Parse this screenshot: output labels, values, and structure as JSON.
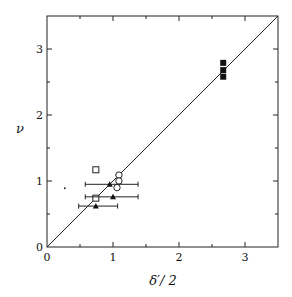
{
  "chart_data": {
    "type": "scatter",
    "title": "",
    "xlabel": "δ′/ 2",
    "ylabel": "ν",
    "xlim": [
      0,
      3.5
    ],
    "ylim": [
      0,
      3.5
    ],
    "x_ticks": [
      0,
      1,
      2,
      3
    ],
    "y_ticks": [
      0,
      1,
      2,
      3
    ],
    "x_minor_ticks": [
      0.5,
      1.5,
      2.5
    ],
    "y_minor_ticks": [
      0.5,
      1.5,
      2.5
    ],
    "grid": false,
    "legend": null,
    "reference_line": {
      "label": "y = x",
      "from": [
        0,
        0
      ],
      "to": [
        3.5,
        3.5
      ]
    },
    "series": [
      {
        "name": "filled-squares",
        "marker": "filled-square",
        "points": [
          {
            "x": 2.67,
            "y": 2.79
          },
          {
            "x": 2.67,
            "y": 2.68
          },
          {
            "x": 2.67,
            "y": 2.58
          }
        ]
      },
      {
        "name": "open-squares",
        "marker": "open-square",
        "points": [
          {
            "x": 0.74,
            "y": 1.17
          },
          {
            "x": 0.74,
            "y": 0.74
          }
        ]
      },
      {
        "name": "open-circles",
        "marker": "open-circle",
        "points": [
          {
            "x": 1.09,
            "y": 1.09
          },
          {
            "x": 1.09,
            "y": 1.0
          },
          {
            "x": 1.06,
            "y": 0.9
          }
        ]
      },
      {
        "name": "filled-triangles",
        "marker": "filled-triangle",
        "points": [
          {
            "x": 0.95,
            "y": 0.95,
            "xerr": [
              0.58,
              1.38
            ]
          },
          {
            "x": 1.0,
            "y": 0.76,
            "xerr": [
              0.58,
              1.38
            ]
          },
          {
            "x": 0.74,
            "y": 0.62,
            "xerr": [
              0.48,
              1.07
            ]
          }
        ]
      },
      {
        "name": "dot",
        "marker": "dot",
        "points": [
          {
            "x": 0.27,
            "y": 0.89
          }
        ]
      }
    ]
  },
  "labels": {
    "x_axis": "δ′/ 2",
    "y_axis": "ν",
    "x_ticks": [
      "0",
      "1",
      "2",
      "3"
    ],
    "y_ticks": [
      "0",
      "1",
      "2",
      "3"
    ]
  }
}
